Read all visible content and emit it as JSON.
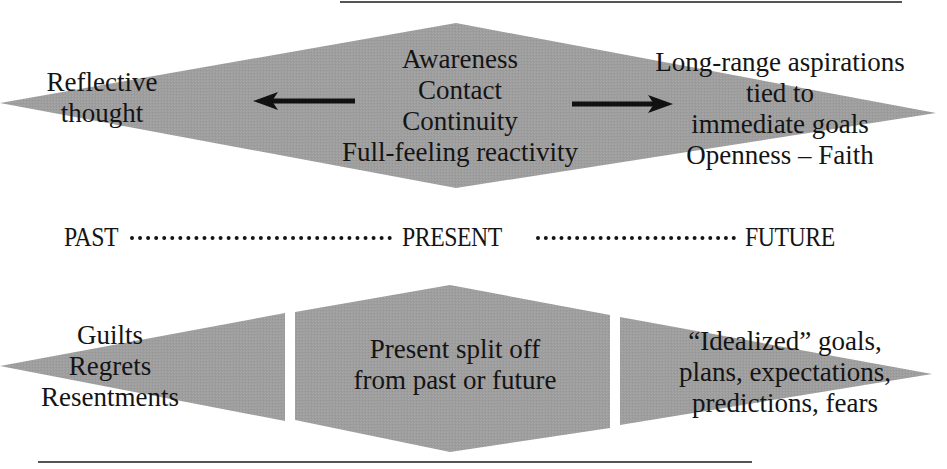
{
  "diagram": {
    "colors": {
      "shape_fill": "#9e9e9e",
      "text": "#141414",
      "rule_line": "#555555",
      "arrow": "#111111"
    },
    "top_band": {
      "left_label": [
        "Reflective",
        "thought"
      ],
      "center_label": [
        "Awareness",
        "Contact",
        "Continuity",
        "Full-feeling reactivity"
      ],
      "right_label": [
        "Long-range aspirations",
        "tied to",
        "immediate goals",
        "Openness – Faith"
      ],
      "arrows": [
        {
          "direction": "left",
          "meaning": "toward past"
        },
        {
          "direction": "right",
          "meaning": "toward future"
        }
      ]
    },
    "timeline": {
      "past": "PAST",
      "present": "PRESENT",
      "future": "FUTURE"
    },
    "bottom_band": {
      "left_label": [
        "Guilts",
        "Regrets",
        "Resentments"
      ],
      "center_label": [
        "Present split off",
        "from past or future"
      ],
      "right_label": [
        "“Idealized” goals,",
        "plans, expectations,",
        "predictions, fears"
      ]
    }
  }
}
